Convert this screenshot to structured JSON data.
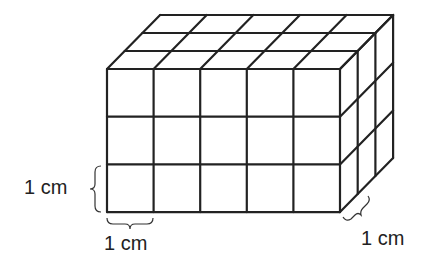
{
  "figure": {
    "dimensions": {
      "length_cubes": 5,
      "height_cubes": 3,
      "depth_cubes": 3
    },
    "stroke_color": "#222222"
  },
  "labels": {
    "height_unit": "1 cm",
    "width_unit": "1 cm",
    "depth_unit": "1 cm"
  }
}
